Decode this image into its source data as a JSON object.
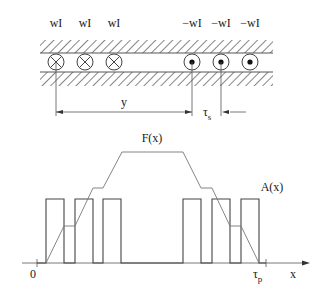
{
  "diagram": {
    "conductors_top_labels": [
      "wI",
      "wI",
      "wI",
      "−wI",
      "−wI",
      "−wI"
    ],
    "conductor_symbols": [
      "cross",
      "cross",
      "cross",
      "dot",
      "dot",
      "dot"
    ],
    "dimension_y_label": "y",
    "dimension_tau_s": {
      "main": "τ",
      "sub": "s"
    },
    "curve_F_label": "F(x)",
    "curve_A_label": "A(x)",
    "axis_origin_label": "0",
    "axis_tau_p": {
      "main": "τ",
      "sub": "p"
    },
    "axis_x_label": "x",
    "colors": {
      "line": "#333333",
      "thin_line": "#777777",
      "hatch": "#444444"
    }
  }
}
